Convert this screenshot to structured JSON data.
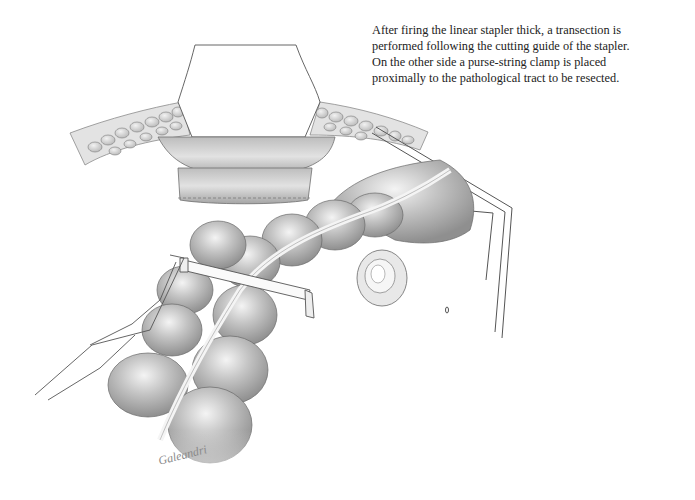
{
  "caption": {
    "lines": [
      "After firing the linear stapler thick, a transection is",
      "performed following the cutting guide of the stapler.",
      "On the other side a purse-string clamp is placed",
      "proximally to the pathological tract to be resected."
    ]
  },
  "illustration": {
    "subject": "surgical-illustration-bowel-transection",
    "elements": [
      "retractor",
      "abdominal-wall-fat-layer",
      "exteriorized-bowel-loop",
      "linear-stapler",
      "purse-string-clamp",
      "stapled-bowel-end"
    ],
    "signature": "Galeandri"
  },
  "colors": {
    "background": "#ffffff",
    "text": "#222222",
    "pencil_dark": "#6e6e6e",
    "pencil_mid": "#a8a8a8",
    "pencil_light": "#d6d6d6"
  }
}
